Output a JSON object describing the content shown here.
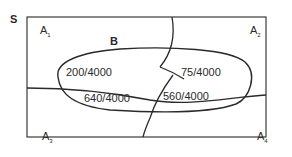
{
  "diagram": {
    "type": "venn-partition",
    "sample_space_label": "S",
    "event_label": "B",
    "partitions": [
      {
        "name": "A",
        "sub": "1"
      },
      {
        "name": "A",
        "sub": "2"
      },
      {
        "name": "A",
        "sub": "3"
      },
      {
        "name": "A",
        "sub": "4"
      }
    ],
    "intersections": [
      {
        "region": "A1 ∩ B",
        "value": "200/4000"
      },
      {
        "region": "A2 ∩ B",
        "value": "75/4000"
      },
      {
        "region": "A3 ∩ B",
        "value": "640/4000"
      },
      {
        "region": "A4 ∩ B",
        "value": "560/4000"
      }
    ],
    "colors": {
      "line": "#2a2a2a",
      "background": "#ffffff"
    }
  }
}
